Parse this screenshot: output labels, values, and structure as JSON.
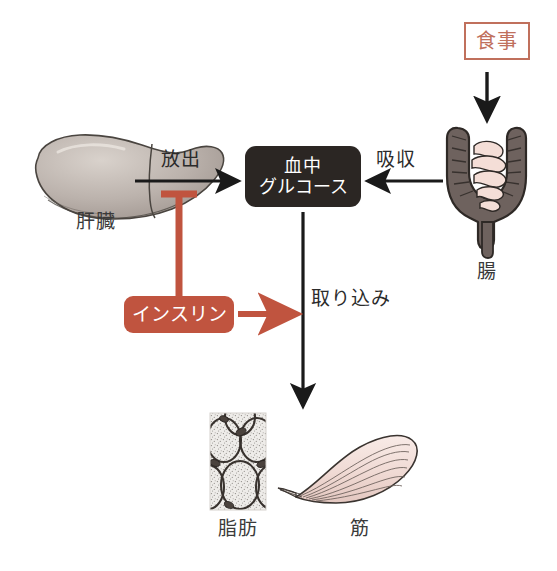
{
  "diagram": {
    "colors": {
      "accent_red": "#c0543f",
      "meal_border": "#c0705c",
      "box_dark": "#2b2623",
      "arrow_black": "#1a1a1a",
      "label_gray": "#3a3a3a",
      "organ_liver": "#b4aca6",
      "organ_intestine_outer": "#6e625e",
      "organ_intestine_inner": "#f4ded7",
      "muscle_pink": "#f3ded9",
      "fat_fill": "#eceae6"
    },
    "nodes": {
      "meal": {
        "label": "食事",
        "type": "outlined-box"
      },
      "blood_glucose": {
        "label_line1": "血中",
        "label_line2": "グルコース",
        "type": "filled-dark-box"
      },
      "insulin": {
        "label": "インスリン",
        "type": "filled-red-box"
      },
      "liver": {
        "label": "肝臓",
        "type": "organ-illustration"
      },
      "intestine": {
        "label": "腸",
        "type": "organ-illustration"
      },
      "fat": {
        "label": "脂肪",
        "type": "tissue-illustration"
      },
      "muscle": {
        "label": "筋",
        "type": "tissue-illustration"
      }
    },
    "edges": {
      "release": {
        "label": "放出",
        "from": "liver",
        "to": "blood_glucose",
        "style": "black-arrow"
      },
      "absorption": {
        "label": "吸収",
        "from": "intestine",
        "to": "blood_glucose",
        "style": "black-arrow"
      },
      "meal_to_intestine": {
        "label": "",
        "from": "meal",
        "to": "intestine",
        "style": "black-arrow"
      },
      "uptake": {
        "label": "取り込み",
        "from": "blood_glucose",
        "to": "fat_and_muscle",
        "style": "black-arrow"
      },
      "insulin_inhibits_release": {
        "label": "",
        "from": "insulin",
        "to": "release",
        "style": "red-inhibition-tbar"
      },
      "insulin_promotes_uptake": {
        "label": "",
        "from": "insulin",
        "to": "uptake",
        "style": "red-arrow"
      }
    }
  }
}
